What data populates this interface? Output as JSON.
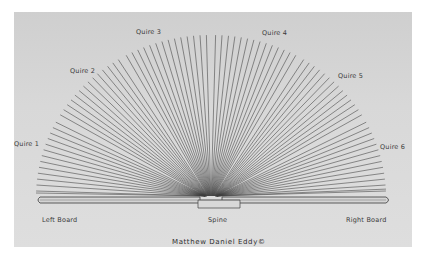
{
  "diagram": {
    "quires": [
      {
        "label": "Quire 1"
      },
      {
        "label": "Quire 2"
      },
      {
        "label": "Quire 3"
      },
      {
        "label": "Quire 4"
      },
      {
        "label": "Quire 5"
      },
      {
        "label": "Quire 6"
      }
    ],
    "parts": {
      "left_board": "Left Board",
      "spine": "Spine",
      "right_board": "Right Board"
    },
    "credit": "Matthew Daniel Eddy©",
    "colors": {
      "paper": "#d6d6d6",
      "line": "#3c3c3c",
      "background": "#ffffff"
    }
  }
}
